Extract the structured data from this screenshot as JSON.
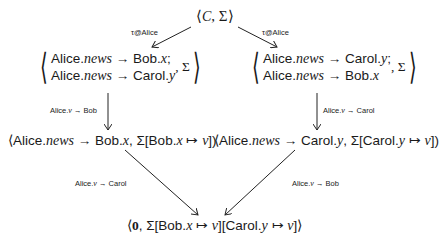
{
  "diagram": {
    "top": {
      "open": "⟨",
      "c": "C",
      "sep": ", ",
      "sigma": "Σ",
      "close": "⟩"
    },
    "edges": {
      "top_left_label": "τ@Alice",
      "top_right_label": "τ@Alice",
      "mid_left_label": {
        "pre": "Alice.",
        "var": "v",
        "post": " → Bob"
      },
      "mid_right_label": {
        "pre": "Alice.",
        "var": "v",
        "post": " → Carol"
      },
      "bottom_left_label": {
        "pre": "Alice.",
        "var": "v",
        "post": " → Carol"
      },
      "bottom_right_label": {
        "pre": "Alice.",
        "var": "v",
        "post": " → Bob"
      }
    },
    "left_pair": {
      "line1": {
        "a": "Alice.",
        "news": "news",
        "arrow": " → Bob.",
        "x": "x",
        "end": ";"
      },
      "line2": {
        "a": "Alice.",
        "news": "news",
        "arrow": " → Carol.",
        "y": "y"
      },
      "sigma": ", Σ"
    },
    "right_pair": {
      "line1": {
        "a": "Alice.",
        "news": "news",
        "arrow": " → Carol.",
        "y": "y",
        "end": ";"
      },
      "line2": {
        "a": "Alice.",
        "news": "news",
        "arrow": " → Bob.",
        "x": "x"
      },
      "sigma": ", Σ"
    },
    "left_state": {
      "open": "⟨Alice.",
      "news": "news",
      "mid": " → Bob.",
      "x": "x",
      "rest": ", Σ[Bob.",
      "x2": "x",
      "maps": " ↦ ",
      "v": "v",
      "close": "])"
    },
    "right_state": {
      "open": "⟨Alice.",
      "news": "news",
      "mid": " → Carol.",
      "y": "y",
      "rest": ", Σ[Carol.",
      "y2": "y",
      "maps": " ↦ ",
      "v": "v",
      "close": "])"
    },
    "bottom": {
      "open": "⟨",
      "zero": "0",
      "a": ", Σ[Bob.",
      "x": "x",
      "m1": " ↦ ",
      "v1": "v",
      "b": "][Carol.",
      "y": "y",
      "m2": " ↦ ",
      "v2": "v",
      "close": "]⟩"
    }
  }
}
